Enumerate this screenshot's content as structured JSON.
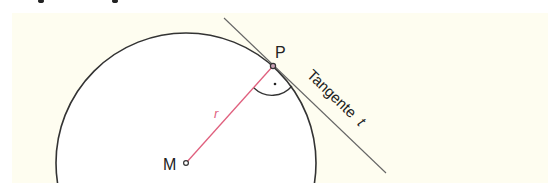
{
  "figure": {
    "colors": {
      "panel_background": "#fefdf0",
      "circle_fill": "#ffffff",
      "circle_stroke": "#333333",
      "radius_line": "#e0607e",
      "tangent_line": "#666666",
      "text": "#222222"
    },
    "labels": {
      "center": "M",
      "point": "P",
      "radius": "r",
      "tangent_word": "Tangente",
      "tangent_symbol": "t",
      "right_angle_dot": "·"
    },
    "geometry": {
      "center": [
        186,
        163
      ],
      "radius": 130,
      "point_P": [
        273,
        66
      ],
      "tangent_start": [
        224,
        18
      ],
      "tangent_end": [
        386,
        173
      ]
    }
  }
}
